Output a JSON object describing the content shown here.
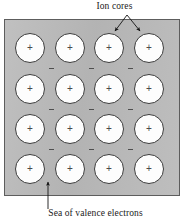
{
  "figure": {
    "type": "diagram",
    "top_label": "Ion cores",
    "bottom_label": "Sea of valence electrons",
    "background_color": "#ffffff",
    "block_fill_color": "#b9b9b9",
    "block_border_color": "#5d5d5d",
    "ion_core_fill_color": "#fdfdfd",
    "ion_core_border_color": "#3c3c3c",
    "charge_symbol": "+",
    "electron_symbol": "−"
  },
  "block": {
    "x": 4,
    "y": 19,
    "width": 176,
    "height": 177
  },
  "lattice": {
    "rows": 4,
    "columns": 4,
    "circle_diameter": 30,
    "centers_x": [
      29,
      69,
      108,
      148
    ],
    "centers_y": [
      47,
      88,
      128,
      168
    ],
    "ion_cores": [
      {
        "row": 1,
        "col": 1,
        "cx": 29,
        "cy": 47,
        "charge": "+"
      },
      {
        "row": 1,
        "col": 2,
        "cx": 69,
        "cy": 47,
        "charge": "+"
      },
      {
        "row": 1,
        "col": 3,
        "cx": 108,
        "cy": 47,
        "charge": "+"
      },
      {
        "row": 1,
        "col": 4,
        "cx": 148,
        "cy": 47,
        "charge": "+"
      },
      {
        "row": 2,
        "col": 1,
        "cx": 29,
        "cy": 88,
        "charge": "+"
      },
      {
        "row": 2,
        "col": 2,
        "cx": 69,
        "cy": 88,
        "charge": "+"
      },
      {
        "row": 2,
        "col": 3,
        "cx": 108,
        "cy": 88,
        "charge": "+"
      },
      {
        "row": 2,
        "col": 4,
        "cx": 148,
        "cy": 88,
        "charge": "+"
      },
      {
        "row": 3,
        "col": 1,
        "cx": 29,
        "cy": 128,
        "charge": "+"
      },
      {
        "row": 3,
        "col": 2,
        "cx": 69,
        "cy": 128,
        "charge": "+"
      },
      {
        "row": 3,
        "col": 3,
        "cx": 108,
        "cy": 128,
        "charge": "+"
      },
      {
        "row": 3,
        "col": 4,
        "cx": 148,
        "cy": 128,
        "charge": "+"
      },
      {
        "row": 4,
        "col": 1,
        "cx": 29,
        "cy": 168,
        "charge": "+"
      },
      {
        "row": 4,
        "col": 2,
        "cx": 69,
        "cy": 168,
        "charge": "+"
      },
      {
        "row": 4,
        "col": 3,
        "cx": 108,
        "cy": 168,
        "charge": "+"
      },
      {
        "row": 4,
        "col": 4,
        "cx": 148,
        "cy": 168,
        "charge": "+"
      }
    ],
    "electrons": [
      {
        "gap": 1,
        "cx": 50,
        "cy": 67
      },
      {
        "gap": 1,
        "cx": 90,
        "cy": 67
      },
      {
        "gap": 1,
        "cx": 129,
        "cy": 67
      },
      {
        "gap": 2,
        "cx": 50,
        "cy": 108
      },
      {
        "gap": 2,
        "cx": 90,
        "cy": 108
      },
      {
        "gap": 2,
        "cx": 129,
        "cy": 108
      },
      {
        "gap": 3,
        "cx": 50,
        "cy": 148
      },
      {
        "gap": 3,
        "cx": 90,
        "cy": 148
      },
      {
        "gap": 3,
        "cx": 129,
        "cy": 148
      }
    ]
  },
  "annotations": {
    "ion_cores_callout": {
      "label": "Ion cores",
      "origin": {
        "x": 127,
        "y": 15
      },
      "arrow_targets": [
        {
          "x": 114,
          "y": 33
        },
        {
          "x": 141,
          "y": 33
        }
      ]
    },
    "electron_sea_callout": {
      "label": "Sea of valence electrons",
      "origin": {
        "x": 48,
        "y": 209
      },
      "arrow_target": {
        "x": 48,
        "y": 181
      }
    }
  }
}
